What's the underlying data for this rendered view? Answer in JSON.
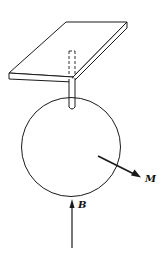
{
  "diagram": {
    "labels": {
      "magnetization": "M",
      "field": "B"
    },
    "colors": {
      "stroke": "#1a1a1a",
      "background": "#ffffff"
    }
  }
}
